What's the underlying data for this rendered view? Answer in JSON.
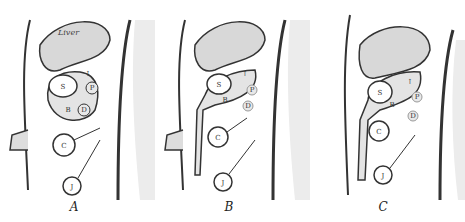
{
  "figure": {
    "panels": [
      {
        "caption": "A",
        "labels": {
          "liver": "Liver",
          "stomach": "S",
          "bursa": "B",
          "pancreas": "P",
          "duodenum": "D",
          "colon": "C",
          "jejunum": "J",
          "arrow": "↑"
        }
      },
      {
        "caption": "B",
        "labels": {
          "stomach": "S",
          "bursa": "B",
          "pancreas": "P",
          "duodenum": "D",
          "colon": "C",
          "jejunum": "J",
          "arrow": "↑"
        }
      },
      {
        "caption": "C",
        "labels": {
          "stomach": "S",
          "bursa": "B",
          "pancreas": "P",
          "duodenum": "D",
          "colon": "C",
          "jejunum": "J",
          "arrow": "↑"
        }
      }
    ],
    "colors": {
      "ink": "#333333",
      "fill": "#d8d8d8",
      "stipple": "#bfbfbf",
      "background": "#ffffff"
    }
  }
}
